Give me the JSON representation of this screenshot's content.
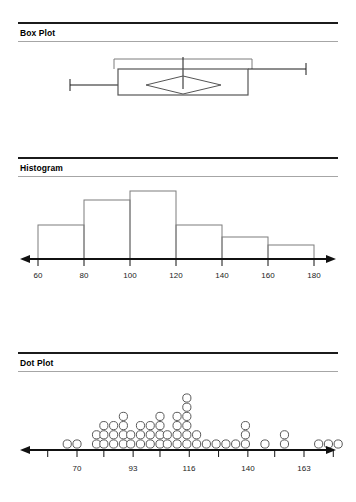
{
  "panels": [
    {
      "id": "box-plot",
      "title": "Box Plot"
    },
    {
      "id": "histogram",
      "title": "Histogram"
    },
    {
      "id": "dot-plot",
      "title": "Dot Plot"
    }
  ],
  "chart_data": [
    {
      "type": "box",
      "title": "Box Plot",
      "orientation": "horizontal",
      "xlabel": "",
      "ylabel": "",
      "xlim": [
        55,
        195
      ],
      "grid": false,
      "legend": null,
      "tick_labels": [],
      "stats": {
        "min_whisker": 69,
        "q1": 93,
        "median": 116,
        "q3": 147,
        "max_whisker": 184,
        "mean": 116,
        "mean_diamond_low": 104,
        "mean_diamond_high": 129,
        "confidence_bracket_low": 92,
        "confidence_bracket_high": 153
      }
    },
    {
      "type": "bar",
      "subtype": "histogram",
      "title": "Histogram",
      "xlabel": "",
      "ylabel": "",
      "xlim": [
        52,
        192
      ],
      "ylim": [
        0,
        26
      ],
      "grid": false,
      "legend": null,
      "tick_labels": [
        "60",
        "80",
        "100",
        "120",
        "140",
        "160",
        "180"
      ],
      "tick_values": [
        60,
        80,
        100,
        120,
        140,
        160,
        180
      ],
      "bin_edges": [
        60,
        80,
        100,
        120,
        140,
        160,
        180
      ],
      "categories": [
        "60-80",
        "80-100",
        "100-120",
        "120-140",
        "140-160",
        "160-180"
      ],
      "values": [
        11,
        19,
        22,
        11,
        7,
        5
      ]
    },
    {
      "type": "scatter",
      "subtype": "dotplot",
      "title": "Dot Plot",
      "xlabel": "",
      "ylabel": "",
      "xlim": [
        55,
        185
      ],
      "grid": false,
      "legend": null,
      "tick_labels": [
        "70",
        "93",
        "116",
        "140",
        "163"
      ],
      "tick_values": [
        70,
        93,
        116,
        140,
        163
      ],
      "minor_tick_values": [
        58,
        81,
        104,
        128,
        151,
        175
      ],
      "x": [
        66,
        70,
        78,
        81,
        85,
        89,
        92,
        96,
        100,
        104,
        107,
        111,
        115,
        119,
        123,
        127,
        131,
        135,
        139,
        147,
        155,
        169,
        173,
        177
      ],
      "counts": [
        1,
        1,
        2,
        3,
        3,
        4,
        2,
        3,
        3,
        4,
        2,
        4,
        6,
        2,
        1,
        1,
        1,
        1,
        3,
        1,
        2,
        1,
        1,
        1
      ]
    }
  ]
}
